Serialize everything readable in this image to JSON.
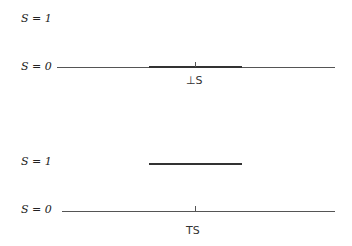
{
  "top_panel": {
    "s1_label": "S = 1",
    "s0_label": "S = 0",
    "caption": "⊥S"
  },
  "bottom_panel": {
    "s1_label": "S = 1",
    "s0_label": "S = 0",
    "caption": "TS"
  }
}
